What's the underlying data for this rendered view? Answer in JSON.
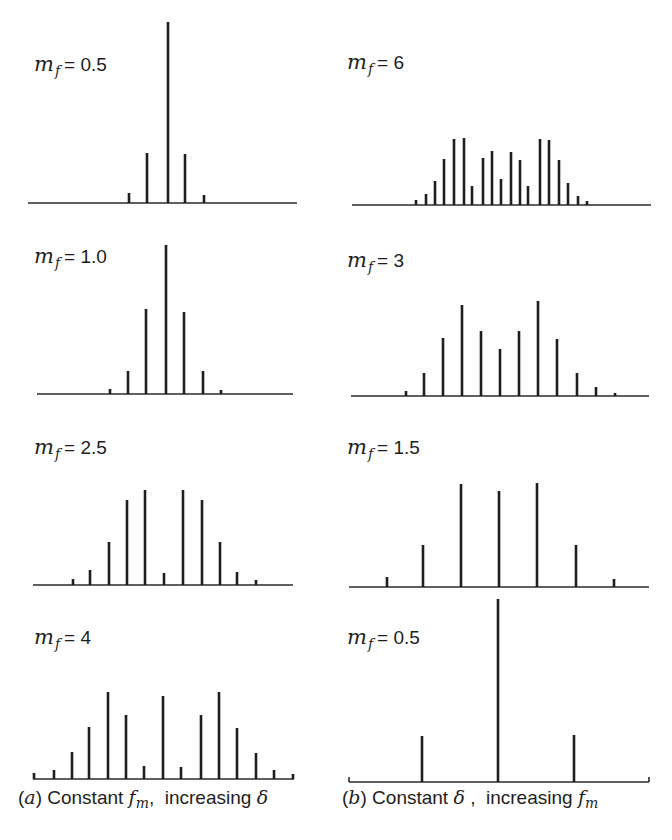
{
  "figure": {
    "captions": {
      "a": {
        "prefix": "(",
        "letter": "a",
        "close": ")",
        "text1": " Constant ",
        "var": "f",
        "var_sub": "m",
        "text2": ",  increasing ",
        "symbol": "δ",
        "x": 18,
        "y": 786
      },
      "b": {
        "prefix": "(",
        "letter": "b",
        "close": ")",
        "text1": " Constant ",
        "symbol": "δ",
        "text2": " ,  increasing ",
        "var": "f",
        "var_sub": "m",
        "x": 342,
        "y": 786
      }
    },
    "label_var": "m",
    "label_sub": "f",
    "line_color": "#1e1e1e",
    "background": "#ffffff"
  },
  "chart_data": [
    {
      "type": "bar",
      "panel": "a1",
      "column": "(a) Constant f_m, increasing δ",
      "title": "m_f = 0.5",
      "label_value": "0.5",
      "label_pos": [
        34,
        52
      ],
      "baseline_y": 203,
      "x_range": [
        28,
        297
      ],
      "x": [
        129,
        147,
        168,
        185,
        204
      ],
      "values": [
        10,
        50,
        181,
        49,
        8
      ],
      "end_ticks": false
    },
    {
      "type": "bar",
      "panel": "a2",
      "column": "(a) Constant f_m, increasing δ",
      "title": "m_f = 1.0",
      "label_value": "1.0",
      "label_pos": [
        34,
        244
      ],
      "baseline_y": 394,
      "x_range": [
        37,
        293
      ],
      "x": [
        110,
        128,
        146,
        166,
        184,
        203,
        221
      ],
      "values": [
        5,
        23,
        85,
        149,
        82,
        23,
        4
      ],
      "end_ticks": false
    },
    {
      "type": "bar",
      "panel": "a3",
      "column": "(a) Constant f_m, increasing δ",
      "title": "m_f = 2.5",
      "label_value": "2.5",
      "label_pos": [
        34,
        435
      ],
      "baseline_y": 585,
      "x_range": [
        33,
        293
      ],
      "x": [
        73,
        90,
        109,
        127,
        145,
        164,
        183,
        202,
        220,
        237,
        256
      ],
      "values": [
        6,
        15,
        43,
        85,
        95,
        12,
        95,
        85,
        43,
        13,
        5
      ],
      "end_ticks": false
    },
    {
      "type": "bar",
      "panel": "a4",
      "column": "(a) Constant f_m, increasing δ",
      "title": "m_f = 4",
      "label_value": "4",
      "label_pos": [
        34,
        625
      ],
      "baseline_y": 779,
      "x_range": [
        33,
        294
      ],
      "x": [
        34,
        54,
        72,
        89,
        108,
        126,
        144,
        163,
        181,
        201,
        219,
        237,
        256,
        274,
        293
      ],
      "values": [
        6,
        9,
        27,
        52,
        87,
        64,
        13,
        83,
        12,
        64,
        87,
        51,
        26,
        9,
        5
      ],
      "end_ticks": false
    },
    {
      "type": "bar",
      "panel": "b1",
      "column": "(b) Constant δ, increasing f_m",
      "title": "m_f = 6",
      "label_value": "6",
      "label_pos": [
        347,
        50
      ],
      "baseline_y": 205,
      "x_range": [
        352,
        651
      ],
      "x": [
        416,
        426,
        435,
        444,
        454,
        464,
        472,
        483,
        492,
        501,
        511,
        520,
        528,
        540,
        549,
        559,
        568,
        578,
        587
      ],
      "values": [
        5,
        11,
        24,
        46,
        66,
        67,
        19,
        47,
        54,
        26,
        53,
        45,
        19,
        66,
        65,
        45,
        22,
        9,
        4
      ],
      "end_ticks": false
    },
    {
      "type": "bar",
      "panel": "b2",
      "column": "(b) Constant δ, increasing f_m",
      "title": "m_f = 3",
      "label_value": "3",
      "label_pos": [
        347,
        248
      ],
      "baseline_y": 396,
      "x_range": [
        351,
        649
      ],
      "x": [
        406,
        424,
        443,
        462,
        481,
        500,
        519,
        538,
        557,
        577,
        596,
        615
      ],
      "values": [
        5,
        23,
        58,
        91,
        65,
        47,
        65,
        95,
        57,
        23,
        9,
        3
      ],
      "end_ticks": false
    },
    {
      "type": "bar",
      "panel": "b3",
      "column": "(b) Constant δ, increasing f_m",
      "title": "m_f = 1.5",
      "label_value": "1.5",
      "label_pos": [
        347,
        435
      ],
      "baseline_y": 587,
      "x_range": [
        349,
        649
      ],
      "x": [
        387,
        423,
        461,
        499,
        537,
        576,
        614
      ],
      "values": [
        10,
        42,
        103,
        96,
        104,
        42,
        8
      ],
      "end_ticks": false
    },
    {
      "type": "bar",
      "panel": "b4",
      "column": "(b) Constant δ, increasing f_m",
      "title": "m_f = 0.5",
      "label_value": "0.5",
      "label_pos": [
        347,
        625
      ],
      "baseline_y": 782,
      "x_range": [
        349,
        649
      ],
      "x": [
        422,
        498,
        574
      ],
      "values": [
        46,
        183,
        47
      ],
      "end_ticks": true
    }
  ]
}
